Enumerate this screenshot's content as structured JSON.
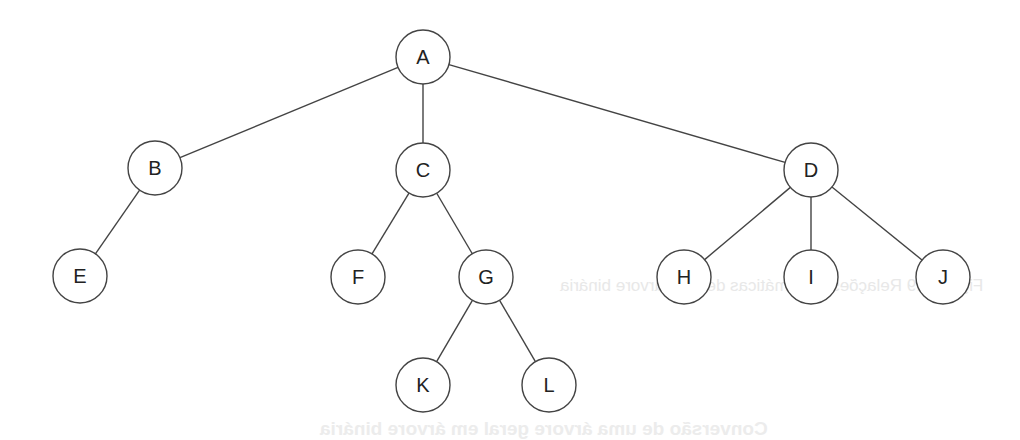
{
  "diagram": {
    "type": "tree",
    "style": {
      "stroke": "#444444",
      "node_fill": "#ffffff",
      "label_color": "#222222",
      "node_radius": 27
    },
    "nodes": [
      {
        "id": "A",
        "label": "A",
        "x": 423,
        "y": 57
      },
      {
        "id": "B",
        "label": "B",
        "x": 155,
        "y": 168
      },
      {
        "id": "C",
        "label": "C",
        "x": 423,
        "y": 170
      },
      {
        "id": "D",
        "label": "D",
        "x": 811,
        "y": 170
      },
      {
        "id": "E",
        "label": "E",
        "x": 80,
        "y": 276
      },
      {
        "id": "F",
        "label": "F",
        "x": 358,
        "y": 277
      },
      {
        "id": "G",
        "label": "G",
        "x": 486,
        "y": 277
      },
      {
        "id": "H",
        "label": "H",
        "x": 684,
        "y": 277
      },
      {
        "id": "I",
        "label": "I",
        "x": 811,
        "y": 277
      },
      {
        "id": "J",
        "label": "J",
        "x": 943,
        "y": 277
      },
      {
        "id": "K",
        "label": "K",
        "x": 423,
        "y": 385
      },
      {
        "id": "L",
        "label": "L",
        "x": 549,
        "y": 385
      }
    ],
    "edges": [
      [
        "A",
        "B"
      ],
      [
        "A",
        "C"
      ],
      [
        "A",
        "D"
      ],
      [
        "B",
        "E"
      ],
      [
        "C",
        "F"
      ],
      [
        "C",
        "G"
      ],
      [
        "G",
        "K"
      ],
      [
        "G",
        "L"
      ],
      [
        "D",
        "H"
      ],
      [
        "D",
        "I"
      ],
      [
        "D",
        "J"
      ]
    ]
  },
  "bleed_through": {
    "caption": "Figura 6.9  Relações matemáticas de uma árvore binária",
    "heading": "Conversão de uma árvore geral em árvore binária"
  }
}
